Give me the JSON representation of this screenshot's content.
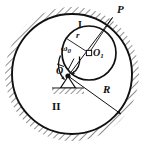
{
  "figure": {
    "canvas": {
      "width": 143,
      "height": 143,
      "background": "#ffffff"
    },
    "colors": {
      "stroke": "#111111",
      "hatch": "#9a9a9a",
      "label": "#111111",
      "background": "#ffffff"
    },
    "outer_circle": {
      "name": "fixed-ring",
      "cx": 72,
      "cy": 74,
      "r": 60,
      "stroke_width": 1.8
    },
    "inner_circle": {
      "name": "rolling-disk",
      "cx": 89,
      "cy": 53,
      "r": 27,
      "stroke_width": 1.6
    },
    "points": {
      "P": {
        "x": 113,
        "y": 16
      },
      "O1": {
        "x": 89,
        "y": 53
      },
      "O": {
        "x": 68,
        "y": 76
      }
    },
    "labels": {
      "P": "P",
      "region_inner": "I",
      "radius_small": "r",
      "center_inner": "O",
      "center_inner_sub": "1",
      "omega": "ω",
      "omega_sub": "0",
      "pivot": "O",
      "radius_large": "R",
      "region_outer": "II"
    }
  }
}
